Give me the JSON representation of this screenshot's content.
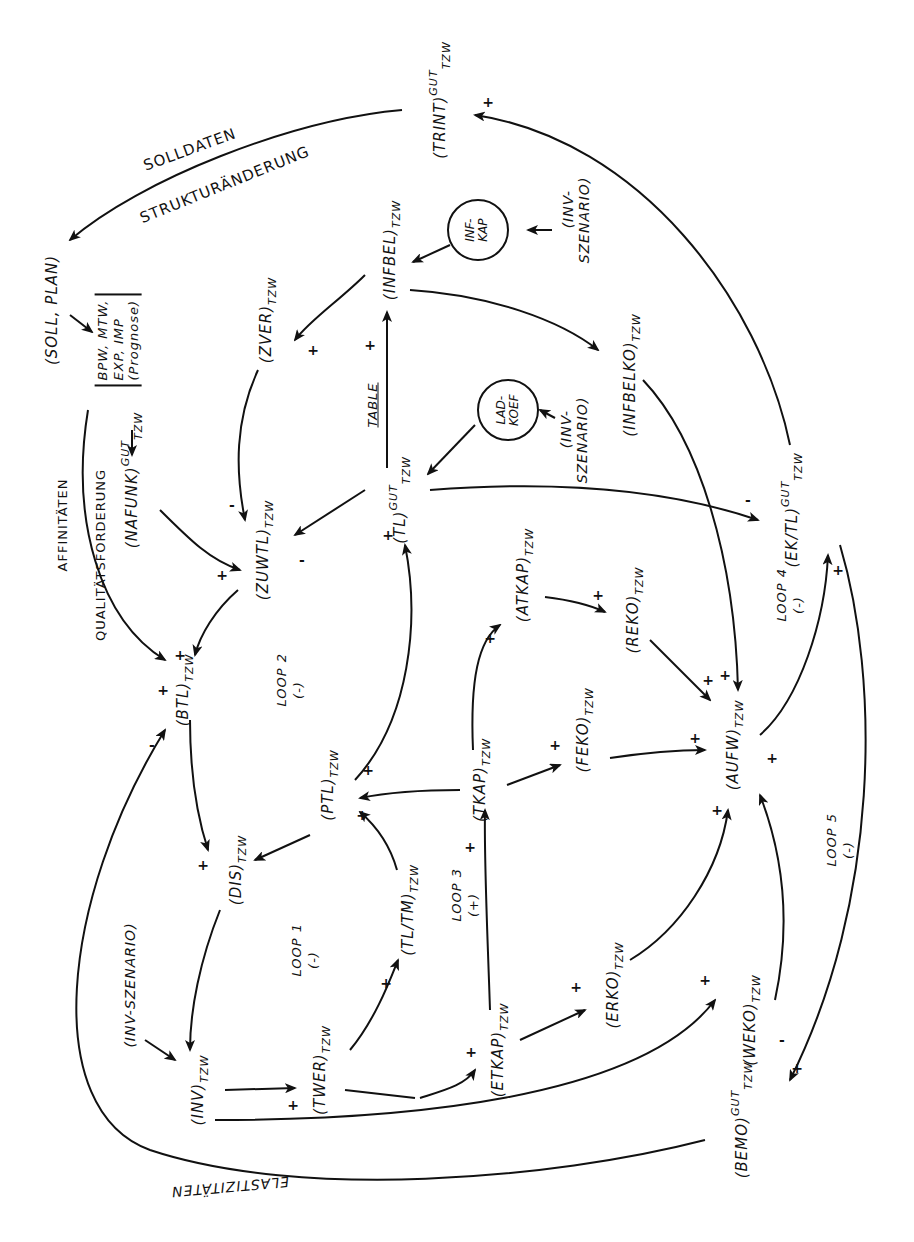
{
  "figure": {
    "type": "causal-loop-diagram",
    "orientation": "rotated 90 degrees (text reads bottom-to-top)"
  },
  "nodes": {
    "trint": {
      "name": "(TRINT)",
      "sup": "GUT",
      "sub": "TZW"
    },
    "soll_plan": {
      "name": "(SOLL, PLAN)"
    },
    "prognose_box": {
      "text": "BPW, MTW,\nEXP, IMP\n(Prognose)"
    },
    "nafunk": {
      "name": "(NAFUNK)",
      "sup": "GUT",
      "sub": "TZW"
    },
    "zver": {
      "name": "(ZVER)",
      "sub": "TZW"
    },
    "infbel": {
      "name": "(INFBEL)",
      "sub": "TZW"
    },
    "infkap": {
      "text": "INF-\nKAP"
    },
    "inv_szenario_top": {
      "name": "(INV-\nSZENARIO)"
    },
    "ladkoef": {
      "text": "LAD-\nKOEF"
    },
    "inv_szenario_mid": {
      "name": "(INV-\nSZENARIO)"
    },
    "infbelko": {
      "name": "(INFBELKO)",
      "sub": "TZW"
    },
    "tl": {
      "name": "(TL)",
      "sup": "GUT",
      "sub": "TZW"
    },
    "table": {
      "name": "TABLE"
    },
    "ek_tl": {
      "name": "(EK/TL)",
      "sup": "GUT",
      "sub": "TZW"
    },
    "zuwtl": {
      "name": "(ZUWTL)",
      "sub": "TZW"
    },
    "atkap": {
      "name": "(ATKAP)",
      "sub": "TZW"
    },
    "reko": {
      "name": "(REKO)",
      "sub": "TZW"
    },
    "btl": {
      "name": "(BTL)",
      "sub": "TZW"
    },
    "aufw": {
      "name": "(AUFW)",
      "sub": "TZW"
    },
    "feko": {
      "name": "(FEKO)",
      "sub": "TZW"
    },
    "tkap": {
      "name": "(TKAP)",
      "sub": "TZW"
    },
    "ptl": {
      "name": "(PTL)",
      "sub": "TZW"
    },
    "dis": {
      "name": "(DIS)",
      "sub": "TZW"
    },
    "tl_tm": {
      "name": "(TL/TM)",
      "sub": "TZW"
    },
    "erko": {
      "name": "(ERKO)",
      "sub": "TZW"
    },
    "weko": {
      "name": "(WEKO)",
      "sub": "TZW"
    },
    "etkap": {
      "name": "(ETKAP)",
      "sub": "TZW"
    },
    "inv_szenario_left": {
      "name": "(INV-SZENARIO)"
    },
    "inv": {
      "name": "(INV)",
      "sub": "TZW"
    },
    "twer": {
      "name": "(TWER)",
      "sub": "TZW"
    },
    "bemo": {
      "name": "(BEMO)",
      "sup": "GUT",
      "sub": "TZW"
    }
  },
  "edge_labels": {
    "solldaten": "SOLLDATEN",
    "strukturaenderung": "STRUKTURÄNDERUNG",
    "affinitaeten": "AFFINITÄTEN",
    "qualitaetsforderung": "QUALITÄTSFORDERUNG",
    "elastizitaeten": "ELASTIZITÄTEN"
  },
  "loops": [
    {
      "id": "loop1",
      "label": "LOOP 1\n(-)"
    },
    {
      "id": "loop2",
      "label": "LOOP 2\n(-)"
    },
    {
      "id": "loop3",
      "label": "LOOP 3\n(+)"
    },
    {
      "id": "loop4",
      "label": "LOOP 4\n(-)"
    },
    {
      "id": "loop5",
      "label": "LOOP 5\n(-)"
    }
  ],
  "signs": {
    "plus": "+",
    "minus": "-"
  }
}
